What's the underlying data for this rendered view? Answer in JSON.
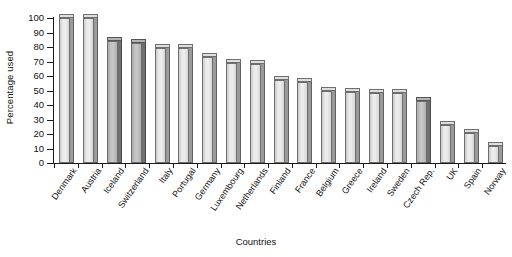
{
  "chart_data": {
    "type": "bar",
    "title": "",
    "xlabel": "Countries",
    "ylabel": "Percentage used",
    "ylim": [
      0,
      100
    ],
    "ytick_step": 10,
    "yticks": [
      0,
      10,
      20,
      30,
      40,
      50,
      60,
      70,
      80,
      90,
      100
    ],
    "grid": false,
    "legend": "none",
    "categories": [
      "Denmark",
      "Austria",
      "Iceland",
      "Switzerland",
      "Italy",
      "Portugal",
      "Germany",
      "Luxembourg",
      "Netherlands",
      "Finland",
      "France",
      "Belgium",
      "Greece",
      "Ireland",
      "Sweden",
      "Czech Rep.",
      "UK",
      "Spain",
      "Norway"
    ],
    "values": [
      100,
      100,
      84,
      83,
      79,
      79,
      73,
      69,
      68,
      57,
      56,
      50,
      49,
      48,
      48,
      43,
      26,
      21,
      12
    ],
    "highlighted_categories": [
      "Iceland",
      "Switzerland",
      "Czech Rep."
    ],
    "bar_colors": {
      "default": "#e5e5e5",
      "highlight": "#bcbcbc",
      "outline": "#6e6e6e"
    }
  },
  "axis": {
    "y_title": "Percentage used",
    "x_title": "Countries",
    "y_tick_labels": [
      "0",
      "10",
      "20",
      "30",
      "40",
      "50",
      "60",
      "70",
      "80",
      "90",
      "100"
    ]
  }
}
